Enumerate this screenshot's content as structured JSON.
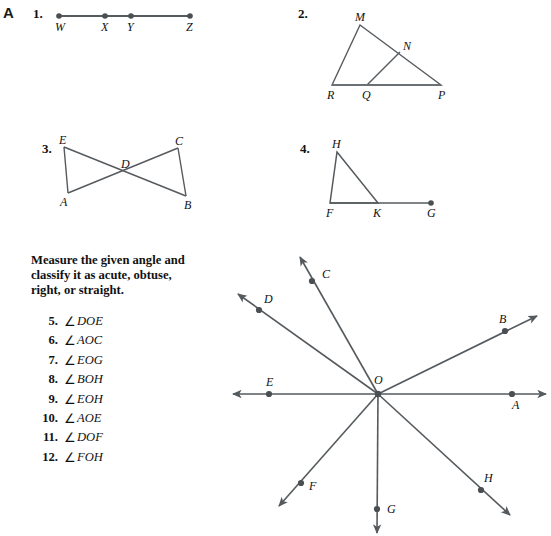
{
  "page": {
    "section_letter": "A",
    "width": 551,
    "height": 536,
    "ink_color": "#555a5e",
    "text_color": "#111111"
  },
  "figures": [
    {
      "number": "1.",
      "name": "segment-wxyz",
      "points": [
        {
          "label": "W",
          "x": 59,
          "y": 16
        },
        {
          "label": "X",
          "x": 105,
          "y": 16
        },
        {
          "label": "Y",
          "x": 131,
          "y": 16
        },
        {
          "label": "Z",
          "x": 190,
          "y": 16
        }
      ]
    },
    {
      "number": "2.",
      "name": "triangle-rmp-with-qn",
      "points": [
        {
          "label": "M",
          "x": 360,
          "y": 25
        },
        {
          "label": "N",
          "x": 400,
          "y": 52
        },
        {
          "label": "R",
          "x": 332,
          "y": 85
        },
        {
          "label": "Q",
          "x": 367,
          "y": 85
        },
        {
          "label": "P",
          "x": 441,
          "y": 85
        }
      ]
    },
    {
      "number": "3.",
      "name": "bowtie-eadcb",
      "points": [
        {
          "label": "E",
          "x": 64,
          "y": 147
        },
        {
          "label": "C",
          "x": 178,
          "y": 148
        },
        {
          "label": "D",
          "x": 125,
          "y": 172
        },
        {
          "label": "A",
          "x": 68,
          "y": 193
        },
        {
          "label": "B",
          "x": 186,
          "y": 196
        }
      ]
    },
    {
      "number": "4.",
      "name": "triangle-fhk-with-g",
      "points": [
        {
          "label": "H",
          "x": 337,
          "y": 152
        },
        {
          "label": "F",
          "x": 330,
          "y": 203
        },
        {
          "label": "K",
          "x": 378,
          "y": 203
        },
        {
          "label": "G",
          "x": 431,
          "y": 203
        }
      ]
    }
  ],
  "instructions": {
    "line1": "Measure the given angle and",
    "line2": "classify it as acute, obtuse,",
    "line3": "right, or straight."
  },
  "exercises": [
    {
      "num": "5.",
      "symbol": "∠",
      "angle": "DOE"
    },
    {
      "num": "6.",
      "symbol": "∠",
      "angle": "AOC"
    },
    {
      "num": "7.",
      "symbol": "∠",
      "angle": "EOG"
    },
    {
      "num": "8.",
      "symbol": "∠",
      "angle": "BOH"
    },
    {
      "num": "9.",
      "symbol": "∠",
      "angle": "EOH"
    },
    {
      "num": "10.",
      "symbol": "∠",
      "angle": "AOE"
    },
    {
      "num": "11.",
      "symbol": "∠",
      "angle": "DOF"
    },
    {
      "num": "12.",
      "symbol": "∠",
      "angle": "FOH"
    }
  ],
  "angle_diagram": {
    "name": "rays-from-point-o",
    "vertex": {
      "label": "O",
      "x": 378,
      "y": 394,
      "label_x": 374,
      "label_y": 384
    },
    "rays": [
      {
        "label": "A",
        "dot_x": 512,
        "dot_y": 394,
        "tip_x": 546,
        "tip_y": 394,
        "label_x": 512,
        "label_y": 409
      },
      {
        "label": "B",
        "dot_x": 505,
        "dot_y": 331,
        "tip_x": 537,
        "tip_y": 316,
        "label_x": 499,
        "label_y": 323
      },
      {
        "label": "C",
        "dot_x": 312,
        "dot_y": 281,
        "tip_x": 300,
        "tip_y": 257,
        "label_x": 322,
        "label_y": 278
      },
      {
        "label": "D",
        "dot_x": 259,
        "dot_y": 310,
        "tip_x": 238,
        "tip_y": 294,
        "label_x": 264,
        "label_y": 303
      },
      {
        "label": "E",
        "dot_x": 269,
        "dot_y": 394,
        "tip_x": 233,
        "tip_y": 394,
        "label_x": 266,
        "label_y": 386
      },
      {
        "label": "F",
        "dot_x": 301,
        "dot_y": 483,
        "tip_x": 279,
        "tip_y": 506,
        "label_x": 309,
        "label_y": 490
      },
      {
        "label": "G",
        "dot_x": 377,
        "dot_y": 509,
        "tip_x": 377,
        "tip_y": 533,
        "label_x": 387,
        "label_y": 513
      },
      {
        "label": "H",
        "dot_x": 481,
        "dot_y": 490,
        "tip_x": 510,
        "tip_y": 515,
        "label_x": 484,
        "label_y": 482
      }
    ]
  }
}
